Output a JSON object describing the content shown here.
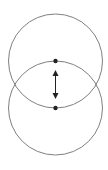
{
  "diagram": {
    "background": "#ffffff",
    "stroke_color": "#808080",
    "dot_color": "#222222",
    "arrow_color": "#222222",
    "circles": [
      {
        "name": "top-circle",
        "cx": 55.5,
        "cy": 61,
        "r": 47
      },
      {
        "name": "bottom-circle",
        "cx": 55.5,
        "cy": 108,
        "r": 47
      }
    ],
    "points": [
      {
        "name": "upper-point",
        "cx": 55.5,
        "cy": 61
      },
      {
        "name": "lower-point",
        "cx": 55.5,
        "cy": 108
      }
    ],
    "arrow": {
      "x": 55.5,
      "y1": 70,
      "y2": 99,
      "type": "double-headed"
    }
  }
}
